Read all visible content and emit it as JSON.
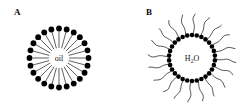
{
  "figure": {
    "background_color": "#ffffff",
    "ink_color": "#000000",
    "width": 248,
    "height": 104
  },
  "panels": [
    {
      "id": "A",
      "label": "A",
      "core_label": "oil",
      "core_label_parts": {
        "main": "oil",
        "subscript": ""
      },
      "type": "normal-micelle",
      "description": "Normal micelle: hydrophilic head groups face outward, hydrophobic tails point inward toward an oil core",
      "center": {
        "x": 59,
        "y": 58
      },
      "head_count": 24,
      "head_radius_px": 2.9,
      "head_ring_radius_px": 29.5,
      "tail_inner_radius_px": 10.5,
      "head_orientation": "outward",
      "tail_orientation": "inward",
      "tail_style": "straight",
      "head_fill": "#000000",
      "tail_stroke": "#1a1a1a",
      "tail_width_px": 0.7
    },
    {
      "id": "B",
      "label": "B",
      "core_label": "H2O",
      "core_label_parts": {
        "main_before": "H",
        "subscript": "2",
        "main_after": "O"
      },
      "type": "reverse-micelle",
      "description": "Reverse micelle: hydrophilic head groups face inward around a water core, hydrophobic tails radiate outward",
      "center": {
        "x": 192,
        "y": 58
      },
      "head_count": 30,
      "head_radius_px": 2.3,
      "head_ring_radius_px": 23.0,
      "tail_outer_radius_px": 44.0,
      "head_orientation": "inward",
      "tail_orientation": "outward",
      "tail_style": "wavy",
      "head_fill": "#000000",
      "tail_stroke": "#2a2a2a",
      "tail_width_px": 0.8,
      "tail_count": 20
    }
  ],
  "legend_notes": {
    "head": "filled circle = polar head group",
    "tail": "line = hydrocarbon tail"
  }
}
